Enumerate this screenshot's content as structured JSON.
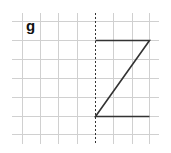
{
  "figure": {
    "label": "g",
    "grid": {
      "vertical_lines_x": [
        22,
        40,
        58,
        77,
        95,
        113,
        132,
        149
      ],
      "horizontal_lines_y": [
        21,
        40,
        59,
        78,
        97,
        116,
        134
      ],
      "x_extent": [
        12,
        159
      ],
      "y_extent": [
        13,
        144
      ],
      "line_color": "#d0d0d0"
    },
    "mirror_line": {
      "x": 95,
      "y1": 13,
      "y2": 144,
      "style": "dashed",
      "color": "#333333"
    },
    "shape": {
      "name": "Z",
      "points": [
        [
          95,
          40
        ],
        [
          149,
          40
        ],
        [
          95,
          116
        ],
        [
          149,
          116
        ]
      ],
      "color": "#333333"
    }
  }
}
